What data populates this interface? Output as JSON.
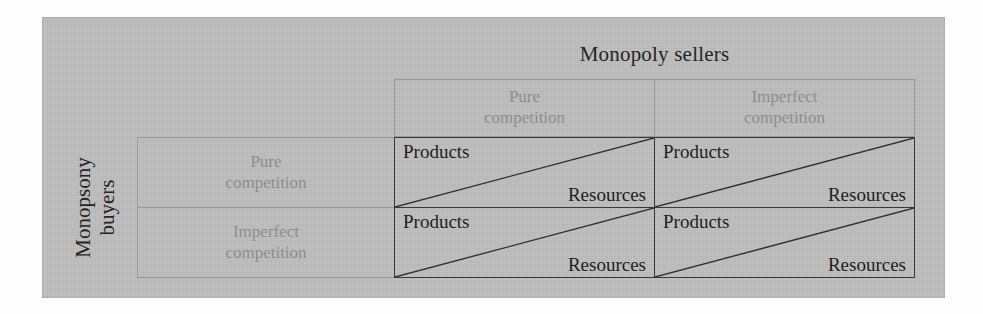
{
  "figure": {
    "column_axis_title": "Monopoly sellers",
    "row_axis_title_line1": "Monopsony",
    "row_axis_title_line2": "buyers",
    "column_headers": [
      {
        "line1": "Pure",
        "line2": "competition"
      },
      {
        "line1": "Imperfect",
        "line2": "competition"
      }
    ],
    "row_headers": [
      {
        "line1": "Pure",
        "line2": "competition"
      },
      {
        "line1": "Imperfect",
        "line2": "competition"
      }
    ],
    "cells": [
      [
        {
          "upper": "Products",
          "lower": "Resources"
        },
        {
          "upper": "Products",
          "lower": "Resources"
        }
      ],
      [
        {
          "upper": "Products",
          "lower": "Resources"
        },
        {
          "upper": "Products",
          "lower": "Resources"
        }
      ]
    ],
    "colors": {
      "panel_background": "#bcbcbc",
      "header_text": "#8e8e8e",
      "body_text": "#1e1e1e",
      "title_text": "#252525",
      "cell_border": "#3a3a3a",
      "header_border": "#9a9a9a"
    }
  }
}
